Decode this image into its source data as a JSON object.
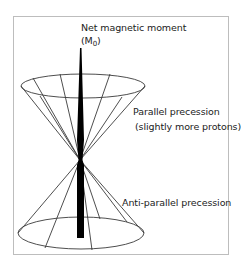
{
  "diagram": {
    "title_line1": "Net magnetic moment",
    "title_line2_prefix": "(M",
    "title_line2_sub": "0",
    "title_line2_suffix": ")",
    "parallel_label_line1": "Parallel precession",
    "parallel_label_line2": "(slightly more protons)",
    "antiparallel_label": "Anti-parallel precession",
    "colors": {
      "line": "#3a3a3a",
      "arrow": "#000000",
      "frame": "#bdbdbd",
      "text": "#222222"
    }
  }
}
